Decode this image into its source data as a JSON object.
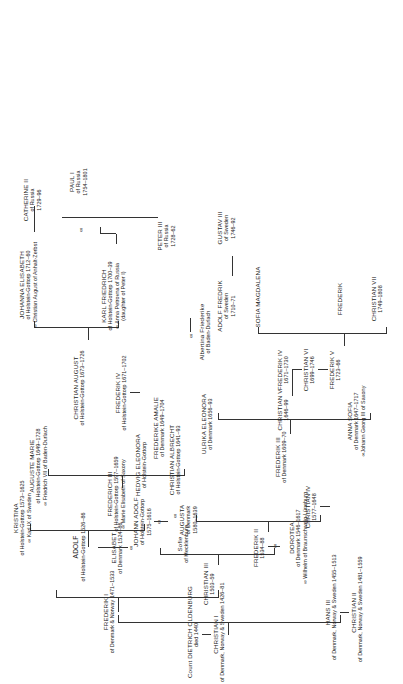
{
  "chart": {
    "type": "genealogy-tree",
    "title": "Count DIETRICH OLDENBURG",
    "title_sub": "died 1440",
    "marriage_symbol": "∞",
    "line_color": "#333333",
    "text_color": "#1a1a1a"
  },
  "nodes": {
    "dietrich": {
      "name": "Count DIETRICH OLDENBURG",
      "sub": "died 1440"
    },
    "christian1": {
      "name": "CHRISTIAN I",
      "sub": "of Denmark, Norway & Sweden 1426–81"
    },
    "hans3": {
      "name": "HANS III",
      "sub": "of Denmark, Norway & Sweden 1455–1513"
    },
    "frederik1": {
      "name": "FREDERIK I",
      "sub": "of Denmark & Norway 1471–1533"
    },
    "christian2": {
      "name": "CHRISTIAN II",
      "sub": "of Denmark, Norway & Sweden 1481–1559"
    },
    "christian3": {
      "name": "CHRISTIAN III",
      "sub": "1503–59"
    },
    "elisabet": {
      "name": "ELISABET",
      "sub": "of Denmark 1524–86"
    },
    "adolf": {
      "name": "ADOLF",
      "sub": "of Holstein-Gottorp 1526–86"
    },
    "frederik2": {
      "name": "FREDERIK II",
      "sub": "1534–88"
    },
    "dorotea": {
      "name": "DOROTEA",
      "sub": "of Denmark 1546–1617",
      "sub2": "∞ Wilhelm of Braunschweig-Lüneburg"
    },
    "sofie": {
      "name": "Sofie",
      "sub": "of Mecklenburg"
    },
    "johann_adolf": {
      "name": "JOHANN ADOLF",
      "sub": "of Holstein-Gottorp",
      "sub2": "1575–1616"
    },
    "kristina": {
      "name": "KRISTINA",
      "sub": "of Holstein-Gottorp 1573–1625",
      "sub2": "∞ Karl IX of Sweden"
    },
    "christian4": {
      "name": "CHRISTIAN IV",
      "sub": "1577–1648"
    },
    "augusta": {
      "name": "AUGUSTA",
      "sub": "of Denmark",
      "sub2": "1580–1639"
    },
    "frederich3_hg": {
      "name": "FREDERICH III",
      "sub": "of Holstein-Gottorp 1597–1659",
      "sub2": "∞ Marie Elisabeth of Saxony"
    },
    "frederik3": {
      "name": "FREDERIK III",
      "sub": "of Denmark 1609–70"
    },
    "ulrika_eleonora": {
      "name": "ULRIKA ELEONORA",
      "sub": "of Denmark 1656–93"
    },
    "hedvig_eleonora": {
      "name": "HEDVIG ELEONORA",
      "sub": "of Holstein-Gottorp"
    },
    "christian_albrecht": {
      "name": "CHRISTIAN ALBRECHT",
      "sub": "of Holstein-Gottorp 1641–93"
    },
    "auguste_marie": {
      "name": "AUGUSTE MARIE",
      "sub": "of Holstein-Gottorp 1649–1728",
      "sub2": "∞ Friedrich VII of Baden-Durlach"
    },
    "anna_sofia": {
      "name": "ANNA SOFIA",
      "sub": "of Denmark 1647–1717",
      "sub2": "∞Johann Georg III of Saxony"
    },
    "christian5": {
      "name": "CHRISTIAN V",
      "sub": "1646–99"
    },
    "frederike_amalie": {
      "name": "FREDERIKE AMALIE",
      "sub": "of Denmark 1649–1704"
    },
    "frederik4": {
      "name": "FREDERIK IV",
      "sub": "1671–1730"
    },
    "frederik4_hg": {
      "name": "FREDERIK IV",
      "sub": "of Holstein-Gottorp 1671–1702"
    },
    "christian_august": {
      "name": "CHRISTIAN AUGUST",
      "sub": "of Holstein-Gottorp 1673–1726"
    },
    "christian6": {
      "name": "CHRISTIAN VI",
      "sub": "1699–1746"
    },
    "karl_friedrich": {
      "name": "KARL FRIEDRICH",
      "sub": "of Holstein-Gottorp 1700–39",
      "sub2": "∞ Anna Petrovna of Russia",
      "sub3": "(daughter of Peter I)"
    },
    "johanna_elisabeth": {
      "name": "JOHANNA ELISABETH",
      "sub": "of Holstein-Gottorp 1712–60",
      "sub2": "∞ Christian August of Anhalt-Zerbst"
    },
    "adolf_fredrik": {
      "name": "ADOLF FREDRIK",
      "sub": "of Sweden",
      "sub2": "1710–71"
    },
    "albertina": {
      "name": "Albertina Friederike",
      "sub": "of Baden-Durlach"
    },
    "frederik5": {
      "name": "FREDERIK V",
      "sub": "1723–66"
    },
    "peter3": {
      "name": "PETER III",
      "sub": "of Russia",
      "sub2": "1728–62"
    },
    "catherine2": {
      "name": "CATHERINE II",
      "sub": "of Russia",
      "sub2": "1729–96"
    },
    "paul1": {
      "name": "PAUL I",
      "sub": "of Russia",
      "sub2": "1754–1801"
    },
    "gustav3": {
      "name": "GUSTAV III",
      "sub": "of Sweden",
      "sub2": "1746–92"
    },
    "christian7": {
      "name": "CHRISTIAN VII",
      "sub": "1749–1808"
    },
    "frederik_son": {
      "name": "FREDERIK",
      "sub": ""
    },
    "sofia_magdalena": {
      "name": "SOFIA MAGDALENA",
      "sub": ""
    }
  }
}
